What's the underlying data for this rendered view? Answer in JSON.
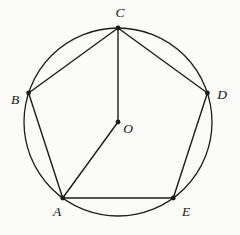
{
  "figure": {
    "background": "#fbfbf9",
    "stroke_color": "#1c1c1c",
    "label_color": "#141414",
    "circle": {
      "cx": 118,
      "cy": 122,
      "r": 94
    },
    "points": {
      "A": {
        "x": 62.7,
        "y": 198
      },
      "B": {
        "x": 28.6,
        "y": 93
      },
      "C": {
        "x": 118,
        "y": 28
      },
      "D": {
        "x": 207.4,
        "y": 93
      },
      "E": {
        "x": 173.3,
        "y": 198
      },
      "O": {
        "x": 118,
        "y": 122
      }
    },
    "segments": [
      {
        "from": "A",
        "to": "B"
      },
      {
        "from": "B",
        "to": "C"
      },
      {
        "from": "C",
        "to": "D"
      },
      {
        "from": "D",
        "to": "E"
      },
      {
        "from": "E",
        "to": "A"
      },
      {
        "from": "C",
        "to": "O"
      },
      {
        "from": "O",
        "to": "A"
      }
    ],
    "labels": [
      {
        "text": "A",
        "x": 57,
        "y": 216
      },
      {
        "text": "B",
        "x": 15,
        "y": 104
      },
      {
        "text": "C",
        "x": 120,
        "y": 17
      },
      {
        "text": "D",
        "x": 222,
        "y": 99
      },
      {
        "text": "E",
        "x": 186,
        "y": 216
      },
      {
        "text": "O",
        "x": 128,
        "y": 133
      }
    ],
    "dot_radius": 2.4,
    "line_width": 1.4,
    "circle_width": 1.3
  }
}
